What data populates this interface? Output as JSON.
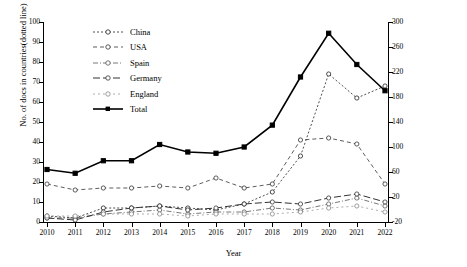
{
  "chart_data": {
    "type": "line",
    "title": "",
    "xlabel": "Year",
    "ylabel_left": "No. of docs in countries(dotted line)",
    "ylabel_right": "Total No. of docs(solid line)",
    "categories": [
      2010,
      2011,
      2012,
      2013,
      2014,
      2015,
      2016,
      2017,
      2018,
      2019,
      2020,
      2021,
      2022
    ],
    "xtick_labels": [
      "2010",
      "2011",
      "2012",
      "2013",
      "2014",
      "2015",
      "2016",
      "2017",
      "2018",
      "2019",
      "2020",
      "2021",
      "2022"
    ],
    "ylim_left": [
      0,
      100
    ],
    "ytick_labels_left": [
      "0",
      "10",
      "20",
      "30",
      "40",
      "50",
      "60",
      "70",
      "80",
      "90",
      "100"
    ],
    "ytick_values_left": [
      0,
      10,
      20,
      30,
      40,
      50,
      60,
      70,
      80,
      90,
      100
    ],
    "ylim_right": [
      -20,
      300
    ],
    "ytick_labels_right": [
      "-20",
      "20",
      "60",
      "100",
      "140",
      "180",
      "220",
      "260",
      "300"
    ],
    "ytick_values_right": [
      -20,
      20,
      60,
      100,
      140,
      180,
      220,
      260,
      300
    ],
    "grid": false,
    "legend_position": "upper-left",
    "series": [
      {
        "name": "China",
        "axis": "left",
        "style": "dotted",
        "marker": "open-circle",
        "values": [
          3,
          2,
          7,
          7,
          8,
          7,
          6,
          9,
          15,
          33,
          74,
          62,
          68
        ]
      },
      {
        "name": "USA",
        "axis": "left",
        "style": "dashed",
        "marker": "open-circle",
        "values": [
          19,
          16,
          17,
          17,
          18,
          17,
          22,
          17,
          19,
          41,
          42,
          39,
          19
        ]
      },
      {
        "name": "Spain",
        "axis": "left",
        "style": "dash-dot",
        "marker": "open-circle",
        "values": [
          2,
          2,
          4,
          5,
          6,
          4,
          5,
          5,
          7,
          6,
          9,
          12,
          8
        ]
      },
      {
        "name": "Germany",
        "axis": "left",
        "style": "long-dash",
        "marker": "open-circle",
        "values": [
          2,
          1,
          5,
          7,
          8,
          6,
          7,
          9,
          10,
          9,
          12,
          14,
          10
        ]
      },
      {
        "name": "England",
        "axis": "left",
        "style": "fine-dash",
        "marker": "open-circle",
        "values": [
          3,
          3,
          4,
          4,
          4,
          3,
          4,
          4,
          4,
          5,
          7,
          8,
          5
        ]
      },
      {
        "name": "Total",
        "axis": "right",
        "style": "solid",
        "marker": "filled-square",
        "values": [
          64,
          58,
          78,
          78,
          104,
          92,
          90,
          100,
          135,
          212,
          282,
          232,
          190
        ]
      }
    ]
  },
  "axes": {
    "left_title": "No. of docs in countries(dotted line)",
    "right_title": "Total No. of docs(solid line)",
    "x_title": "Year"
  },
  "legend": {
    "items": [
      {
        "label": "China"
      },
      {
        "label": "USA"
      },
      {
        "label": "Spain"
      },
      {
        "label": "Germany"
      },
      {
        "label": "England"
      },
      {
        "label": "Total"
      }
    ]
  }
}
